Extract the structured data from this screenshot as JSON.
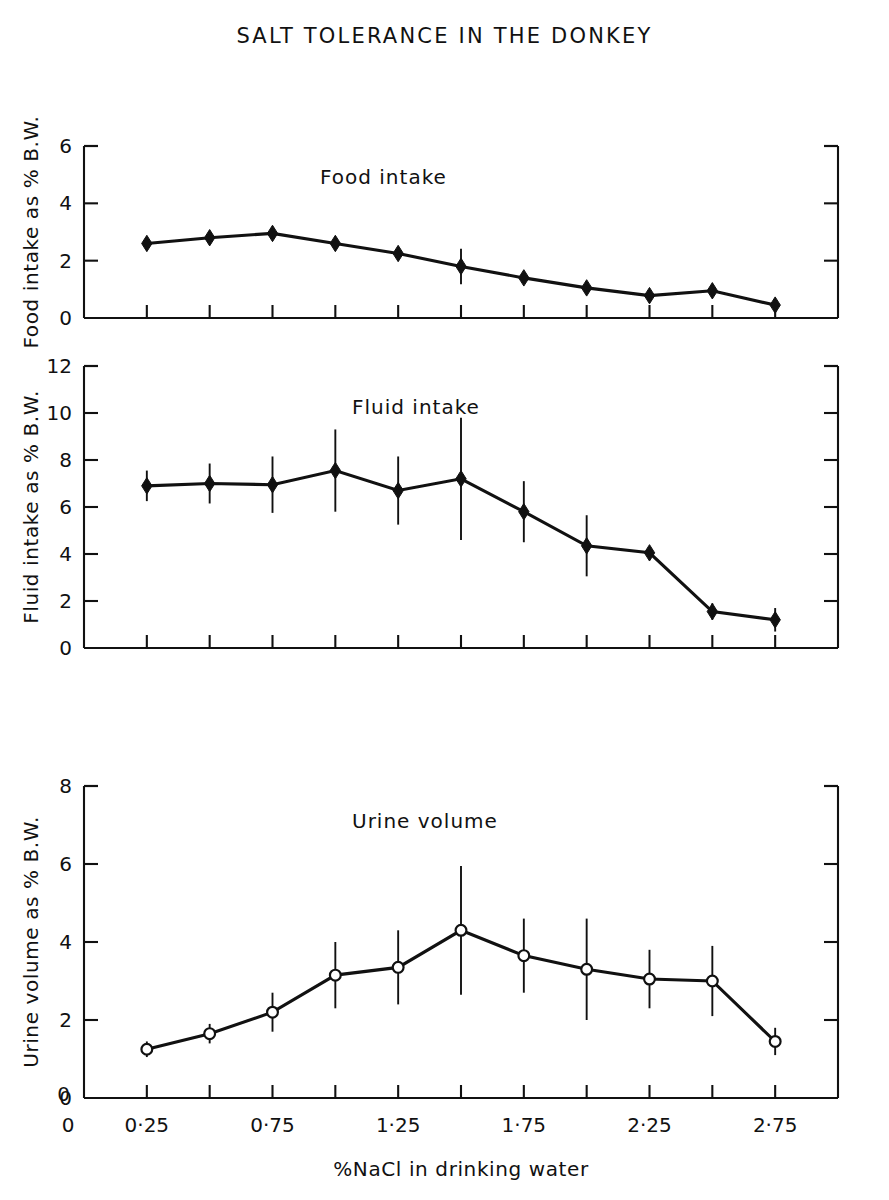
{
  "figure": {
    "title": "SALT TOLERANCE IN THE DONKEY",
    "xlabel": "%NaCl in drinking water",
    "x_origin_label": "0"
  },
  "chart_data": [
    {
      "type": "line",
      "title": "Food intake",
      "panel": 1,
      "xlabel": "%NaCl in drinking water",
      "ylabel": "Food intake as % B.W.",
      "xlim": [
        0,
        3.0
      ],
      "ylim": [
        0,
        6
      ],
      "yticks": [
        0,
        2,
        4,
        6
      ],
      "ytick_labels": [
        "0",
        "2",
        "4",
        "6"
      ],
      "xticks": [
        0.25,
        0.5,
        0.75,
        1.0,
        1.25,
        1.5,
        1.75,
        2.0,
        2.25,
        2.5,
        2.75
      ],
      "marker": "filled-diamond",
      "grid": false,
      "legend": "none",
      "x": [
        0.25,
        0.5,
        0.75,
        1.0,
        1.25,
        1.5,
        1.75,
        2.0,
        2.25,
        2.5,
        2.75
      ],
      "values": [
        2.6,
        2.8,
        2.95,
        2.6,
        2.25,
        1.8,
        1.4,
        1.05,
        0.78,
        0.95,
        0.45
      ],
      "errors": [
        0.22,
        0.12,
        0.12,
        0.1,
        0.1,
        0.62,
        0.12,
        0.12,
        0.1,
        0.1,
        0.22
      ]
    },
    {
      "type": "line",
      "title": "Fluid intake",
      "panel": 2,
      "xlabel": "%NaCl in drinking water",
      "ylabel": "Fluid intake as % B.W.",
      "xlim": [
        0,
        3.0
      ],
      "ylim": [
        0,
        12
      ],
      "yticks": [
        0,
        2,
        4,
        6,
        8,
        10,
        12
      ],
      "ytick_labels": [
        "0",
        "2",
        "4",
        "6",
        "8",
        "10",
        "12"
      ],
      "xticks": [
        0.25,
        0.5,
        0.75,
        1.0,
        1.25,
        1.5,
        1.75,
        2.0,
        2.25,
        2.5,
        2.75
      ],
      "marker": "filled-diamond",
      "grid": false,
      "legend": "none",
      "x": [
        0.25,
        0.5,
        0.75,
        1.0,
        1.25,
        1.5,
        1.75,
        2.0,
        2.25,
        2.5,
        2.75
      ],
      "values": [
        6.9,
        7.0,
        6.95,
        7.55,
        6.7,
        7.2,
        5.8,
        4.35,
        4.05,
        1.55,
        1.2
      ],
      "errors": [
        0.65,
        0.85,
        1.2,
        1.75,
        1.45,
        2.6,
        1.3,
        1.3,
        0.2,
        0.35,
        0.5
      ]
    },
    {
      "type": "line",
      "title": "Urine  volume",
      "panel": 3,
      "xlabel": "%NaCl in drinking water",
      "ylabel": "Urine volume as % B.W.",
      "xlim": [
        0,
        3.0
      ],
      "ylim": [
        0,
        8
      ],
      "yticks": [
        0,
        2,
        4,
        6,
        8
      ],
      "ytick_labels": [
        "0",
        "2",
        "4",
        "6",
        "8"
      ],
      "xticks": [
        0.25,
        0.5,
        0.75,
        1.0,
        1.25,
        1.5,
        1.75,
        2.0,
        2.25,
        2.5,
        2.75
      ],
      "marker": "open-circle",
      "grid": false,
      "legend": "none",
      "x": [
        0.25,
        0.5,
        0.75,
        1.0,
        1.25,
        1.5,
        1.75,
        2.0,
        2.25,
        2.5,
        2.75
      ],
      "values": [
        1.25,
        1.65,
        2.2,
        3.15,
        3.35,
        4.3,
        3.65,
        3.3,
        3.05,
        3.0,
        1.45
      ],
      "errors": [
        0.2,
        0.25,
        0.5,
        0.85,
        0.95,
        1.65,
        0.95,
        1.3,
        0.75,
        0.9,
        0.35
      ]
    }
  ],
  "x_axis": {
    "ticks": [
      {
        "value": 0.25,
        "label": "0·25"
      },
      {
        "value": 0.5,
        "label": ""
      },
      {
        "value": 0.75,
        "label": "0·75"
      },
      {
        "value": 1.0,
        "label": ""
      },
      {
        "value": 1.25,
        "label": "1·25"
      },
      {
        "value": 1.5,
        "label": ""
      },
      {
        "value": 1.75,
        "label": "1·75"
      },
      {
        "value": 2.0,
        "label": ""
      },
      {
        "value": 2.25,
        "label": "2·25"
      },
      {
        "value": 2.5,
        "label": ""
      },
      {
        "value": 2.75,
        "label": "2·75"
      }
    ]
  },
  "colors": {
    "ink": "#111111",
    "background": "#ffffff"
  }
}
